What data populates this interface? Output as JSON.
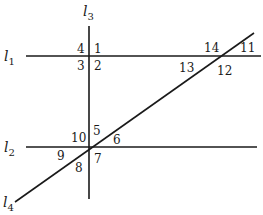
{
  "diagram": {
    "lines": {
      "l1": {
        "name": "l",
        "sub": "1"
      },
      "l2": {
        "name": "l",
        "sub": "2"
      },
      "l3": {
        "name": "l",
        "sub": "3"
      },
      "l4": {
        "name": "l",
        "sub": "4"
      }
    },
    "angles": {
      "a1": "1",
      "a2": "2",
      "a3": "3",
      "a4": "4",
      "a5": "5",
      "a6": "6",
      "a7": "7",
      "a8": "8",
      "a9": "9",
      "a10": "10",
      "a11": "11",
      "a12": "12",
      "a13": "13",
      "a14": "14"
    },
    "colors": {
      "stroke": "#1a1a1a",
      "background": "#ffffff"
    }
  }
}
